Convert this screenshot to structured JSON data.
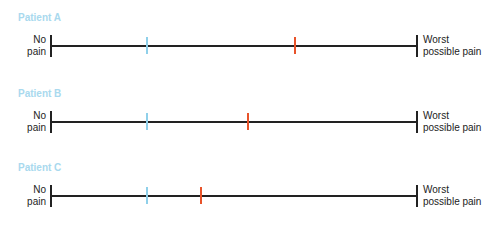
{
  "colors": {
    "title": "#a9d9ee",
    "blue_tick": "#8fd0ea",
    "red_tick": "#e8532a",
    "line": "#222222"
  },
  "scale": {
    "left_label": "No pain",
    "left_label_lines": [
      "No",
      "pain"
    ],
    "right_label_lines": [
      "Worst",
      "possible pain"
    ]
  },
  "patients": [
    {
      "title": "Patient A",
      "blue_pct": 26,
      "red_pct": 67
    },
    {
      "title": "Patient B",
      "blue_pct": 26,
      "red_pct": 54
    },
    {
      "title": "Patient C",
      "blue_pct": 26,
      "red_pct": 41
    }
  ]
}
